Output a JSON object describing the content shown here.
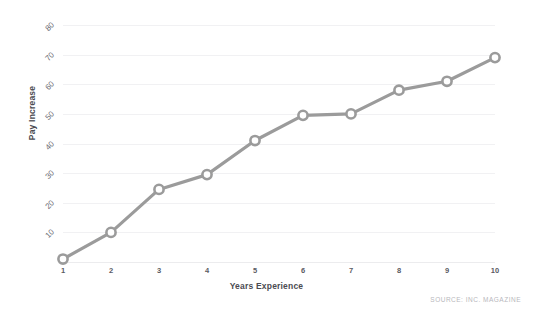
{
  "chart_data": {
    "type": "line",
    "title": "",
    "xlabel": "Years Experience",
    "ylabel": "Pay Increase",
    "x": [
      1,
      2,
      3,
      4,
      5,
      6,
      7,
      8,
      9,
      10
    ],
    "values": [
      1,
      10,
      24.5,
      29.5,
      41,
      49.5,
      50,
      58,
      61,
      69
    ],
    "xtick_labels": [
      "1",
      "2",
      "3",
      "4",
      "5",
      "6",
      "7",
      "8",
      "9",
      "10"
    ],
    "ytick_labels": [
      "10",
      "20",
      "30",
      "40",
      "50",
      "60",
      "70",
      "80"
    ],
    "ytick_values": [
      10,
      20,
      30,
      40,
      50,
      60,
      70,
      80
    ],
    "xlim": [
      1,
      10
    ],
    "ylim": [
      0,
      80
    ],
    "grid": true,
    "legend": false,
    "legend_position": "none",
    "marker": "open-circle",
    "line_color": "#9b9b9b",
    "marker_fill": "#ffffff",
    "marker_stroke": "#9b9b9b",
    "grid_color": "#f1f1f3",
    "background": "#ffffff"
  },
  "annotations": {
    "source": "SOURCE: INC. MAGAZINE"
  }
}
